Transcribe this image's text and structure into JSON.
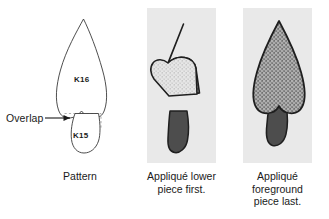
{
  "figure": {
    "name": "applique-order-diagram",
    "background_color": "#ffffff",
    "plate_color": "#e9e9e9"
  },
  "pattern_panel": {
    "overlap_label": "Overlap",
    "upper_piece_label": "K16",
    "lower_piece_label": "K15",
    "line_color": "#3a3a3a",
    "dashed_guide_color": "#9a9a9a"
  },
  "middle_panel": {
    "upper_fabric_color": "#6e6e6e",
    "lower_fabric_color": "#d8d8d8",
    "loose_piece_color": "#4d4d4d",
    "outline_color": "#1f1f1f"
  },
  "right_panel": {
    "foreground_fabric_color": "#8a8a8a",
    "background_piece_color": "#4d4d4d",
    "outline_color": "#1f1f1f"
  },
  "captions": {
    "pattern": "Pattern",
    "middle_line1": "Appliqué lower",
    "middle_line2": "piece first.",
    "right_line1": "Appliqué",
    "right_line2": "foreground",
    "right_line3": "piece last."
  }
}
